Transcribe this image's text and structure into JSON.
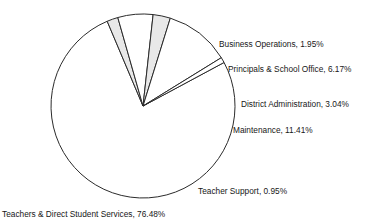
{
  "chart_data": {
    "type": "pie",
    "title": "",
    "subtitle": "",
    "xlabel": "",
    "ylabel": "",
    "legend_position": "none",
    "grid": false,
    "value_unit": "percent",
    "total": 100,
    "categories": [
      "Teachers & Direct Student Services",
      "Business Operations",
      "Principals & School Office",
      "District Administration",
      "Maintenance",
      "Teacher Support"
    ],
    "values": [
      76.48,
      1.95,
      6.17,
      3.04,
      11.41,
      0.95
    ],
    "slices": [
      {
        "name": "Teachers & Direct Student Services",
        "value": 76.48,
        "label": "Teachers & Direct Student Services, 76.48%",
        "fill": "#ffffff",
        "stroke": "#2b2b2b",
        "start_angle": 331.77,
        "end_angle": 607.09,
        "label_x": 2,
        "label_y": 215,
        "label_anchor": "start"
      },
      {
        "name": "Business Operations",
        "value": 1.95,
        "label": "Business Operations, 1.95%",
        "fill": "#e8e8e8",
        "stroke": "#2b2b2b",
        "start_angle": 247.09,
        "end_angle": 254.11,
        "label_x": 219,
        "label_y": 45,
        "label_anchor": "start"
      },
      {
        "name": "Principals & School Office",
        "value": 6.17,
        "label": "Principals & School Office, 6.17%",
        "fill": "#ffffff",
        "stroke": "#2b2b2b",
        "start_angle": 254.11,
        "end_angle": 276.32,
        "label_x": 228,
        "label_y": 70,
        "label_anchor": "start"
      },
      {
        "name": "District Administration",
        "value": 3.04,
        "label": "District Administration, 3.04%",
        "fill": "#e8e8e8",
        "stroke": "#2b2b2b",
        "start_angle": 276.32,
        "end_angle": 287.26,
        "label_x": 241,
        "label_y": 105,
        "label_anchor": "start"
      },
      {
        "name": "Maintenance",
        "value": 11.41,
        "label": "Maintenance, 11.41%",
        "fill": "#ffffff",
        "stroke": "#2b2b2b",
        "start_angle": 287.26,
        "end_angle": 328.33,
        "label_x": 233,
        "label_y": 131,
        "label_anchor": "start"
      },
      {
        "name": "Teacher Support",
        "value": 0.95,
        "label": "Teacher Support, 0.95%",
        "fill": "#ffffff",
        "stroke": "#2b2b2b",
        "start_angle": 328.33,
        "end_angle": 331.77,
        "label_x": 198,
        "label_y": 192,
        "label_anchor": "start"
      }
    ],
    "geometry": {
      "center_x": 143,
      "center_y": 106,
      "radius": 92
    }
  }
}
